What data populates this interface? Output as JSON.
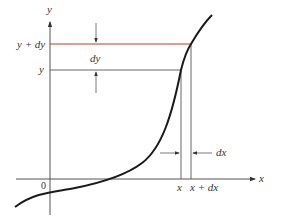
{
  "diagram": {
    "axes": {
      "x_label": "x",
      "y_label": "y",
      "origin_label": "0"
    },
    "horizontal_guides": [
      {
        "label": "y + dy",
        "color": "#c0392b"
      },
      {
        "label": "y",
        "color": "#555555"
      }
    ],
    "vertical_guides": [
      {
        "label": "x"
      },
      {
        "label": "x + dx"
      }
    ],
    "dimension_labels": {
      "dy": "dy",
      "dx": "dx"
    },
    "colors": {
      "curve": "#1a1a1a",
      "axis": "#555555",
      "guide": "#666666",
      "highlight": "#c0392b"
    }
  }
}
